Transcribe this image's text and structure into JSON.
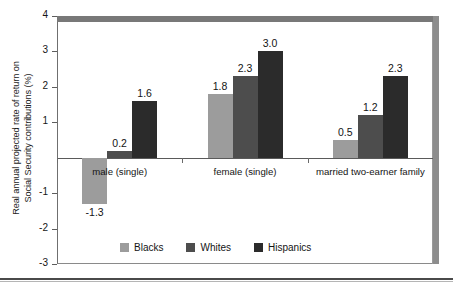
{
  "chart_data": {
    "type": "bar",
    "title": "",
    "xlabel": "",
    "ylabel": "Real annual projected rate of return on Social Security contributions (%)",
    "ylabel_line1": "Real annual projected rate of return on",
    "ylabel_line2": "Social Security contributions (%)",
    "categories": [
      "male (single)",
      "female (single)",
      "married two-earner family"
    ],
    "series": [
      {
        "name": "Blacks",
        "color": "#9c9c9c",
        "values": [
          -1.3,
          1.8,
          0.5
        ]
      },
      {
        "name": "Whites",
        "color": "#4d4d4d",
        "values": [
          0.2,
          2.3,
          1.2
        ]
      },
      {
        "name": "Hispanics",
        "color": "#2b2b2b",
        "values": [
          1.6,
          3.0,
          2.3
        ]
      }
    ],
    "value_labels": [
      [
        "-1.3",
        "0.2",
        "1.6"
      ],
      [
        "1.8",
        "2.3",
        "3.0"
      ],
      [
        "0.5",
        "1.2",
        "2.3"
      ]
    ],
    "ylim": [
      -3,
      4
    ],
    "yticks": [
      4,
      3,
      2,
      1,
      0,
      -1,
      -2,
      -3
    ],
    "ytick_labels": [
      "4",
      "3",
      "2",
      "1",
      "",
      "-1",
      "-2",
      "-3"
    ],
    "grid": false,
    "legend_position": "bottom-inside"
  },
  "legend": {
    "items": [
      {
        "label": "Blacks",
        "color": "#9c9c9c"
      },
      {
        "label": "Whites",
        "color": "#4d4d4d"
      },
      {
        "label": "Hispanics",
        "color": "#2b2b2b"
      }
    ]
  }
}
